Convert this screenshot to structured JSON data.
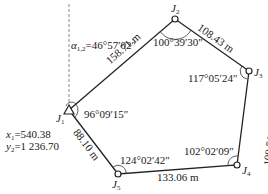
{
  "stations": [
    {
      "id": "J1",
      "letter": "J",
      "sub": "1"
    },
    {
      "id": "J2",
      "letter": "J",
      "sub": "2"
    },
    {
      "id": "J3",
      "letter": "J",
      "sub": "3"
    },
    {
      "id": "J4",
      "letter": "J",
      "sub": "4"
    },
    {
      "id": "J5",
      "letter": "J",
      "sub": "5"
    }
  ],
  "angles": {
    "J1": "96°09′15″",
    "J2": "100°39′30″",
    "J3": "117°05′24″",
    "J4": "102°02′09″",
    "J5": "124°02′42″"
  },
  "distances": {
    "J1_J2": "158.71 m",
    "J2_J3": "108.43 m",
    "J3_J4": "109.51 m",
    "J4_J5": "133.06 m",
    "J5_J1": "88.10 m"
  },
  "azimuth": {
    "symbol": "α",
    "sub": "1,2",
    "value": "=46°57′02″"
  },
  "coords": {
    "x_label": "x",
    "x_sub": "1",
    "x_value": "=540.38",
    "y_label": "y",
    "y_sub": "2",
    "y_value": "=1 236.70"
  }
}
